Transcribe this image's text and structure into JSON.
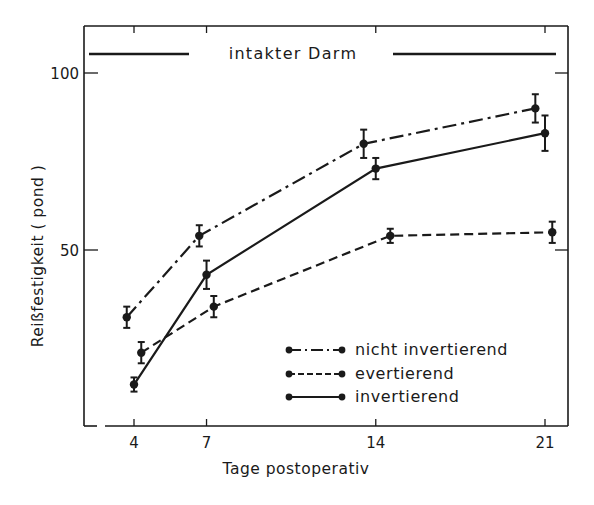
{
  "chart_data": {
    "type": "line",
    "title": "",
    "band_label": "intakter Darm",
    "xlabel": "Tage postoperativ",
    "ylabel": "Reißfestigkeit ( pond )",
    "x_ticks": [
      4,
      7,
      14,
      21
    ],
    "x_tick_labels": [
      "4",
      "7",
      "14",
      "21"
    ],
    "y_ticks": [
      50,
      100
    ],
    "y_tick_labels": [
      "50",
      "100"
    ],
    "ylim": [
      0,
      115
    ],
    "grid": false,
    "legend_position": "lower right inside",
    "series": [
      {
        "name": "nicht invertierend",
        "style": "dash-dot",
        "x": [
          3.7,
          6.7,
          13.5,
          20.6
        ],
        "values": [
          31,
          54,
          80,
          90
        ],
        "errors": [
          3,
          3,
          4,
          4
        ]
      },
      {
        "name": "evertierend",
        "style": "dashed",
        "x": [
          4.3,
          7.3,
          14.6,
          21.3
        ],
        "values": [
          21,
          34,
          54,
          55
        ],
        "errors": [
          3,
          3,
          2,
          3
        ]
      },
      {
        "name": "invertierend",
        "style": "solid",
        "x": [
          4.0,
          7.0,
          14.0,
          21.0
        ],
        "values": [
          12,
          43,
          73,
          83
        ],
        "errors": [
          2,
          4,
          3,
          5
        ]
      }
    ]
  },
  "header": {
    "band_label": "intakter Darm"
  },
  "axes": {
    "xlabel": "Tage postoperativ",
    "ylabel": "Reißfestigkeit ( pond )",
    "x_tick_labels": [
      "4",
      "7",
      "14",
      "21"
    ],
    "y_tick_labels": [
      "50",
      "100"
    ]
  },
  "legend": {
    "items": [
      {
        "label": "nicht invertierend",
        "style": "dash-dot"
      },
      {
        "label": "evertierend",
        "style": "dashed"
      },
      {
        "label": "invertierend",
        "style": "solid"
      }
    ]
  }
}
